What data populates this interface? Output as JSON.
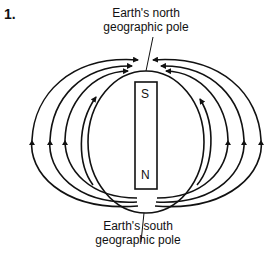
{
  "question_number": "1.",
  "labels": {
    "north_line1": "Earth's north",
    "north_line2": "geographic pole",
    "south_line1": "Earth's south",
    "south_line2": "geographic pole"
  },
  "magnet": {
    "top_pole": "S",
    "bottom_pole": "N"
  }
}
